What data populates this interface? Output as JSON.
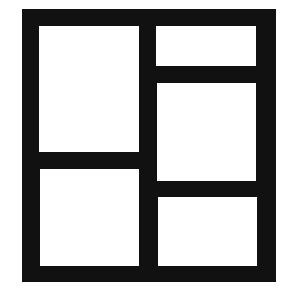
{
  "icon": {
    "name": "layout-grid-icon",
    "description": "Frame divided into five panels: two stacked on the left, three stacked on the right",
    "colors": {
      "frame": "#111111",
      "panel": "#ffffff",
      "background": "#ffffff"
    },
    "panels": [
      {
        "id": "left-top",
        "x": 39,
        "y": 26,
        "w": 100,
        "h": 126
      },
      {
        "id": "left-bottom",
        "x": 40,
        "y": 169,
        "w": 99,
        "h": 97
      },
      {
        "id": "right-top",
        "x": 156,
        "y": 26,
        "w": 100,
        "h": 40
      },
      {
        "id": "right-middle",
        "x": 157,
        "y": 83,
        "w": 99,
        "h": 98
      },
      {
        "id": "right-bottom",
        "x": 158,
        "y": 197,
        "w": 99,
        "h": 69
      }
    ]
  }
}
